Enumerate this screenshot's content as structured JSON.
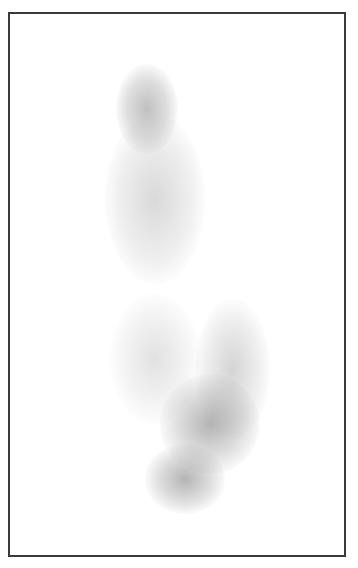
{
  "image": {
    "description": "Grayscale scintigraphy-style image of blurred uptake regions inside a bordered frame",
    "frame_color": "#3a3a3a",
    "background_color": "#ffffff"
  }
}
